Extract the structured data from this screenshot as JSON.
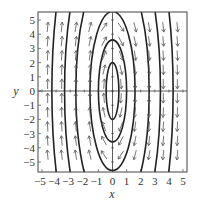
{
  "chart_data": {
    "type": "phase-portrait",
    "title": "",
    "xlabel": "x",
    "ylabel": "y",
    "xlim": [
      -5.3,
      5.3
    ],
    "ylim": [
      -5.7,
      5.5
    ],
    "xticks": [
      -5,
      -4,
      -3,
      -2,
      -1,
      0,
      1,
      2,
      3,
      4,
      5
    ],
    "yticks": [
      -5,
      -4,
      -3,
      -2,
      -1,
      0,
      1,
      2,
      3,
      4,
      5
    ],
    "xtick_labels": [
      "−5",
      "−4",
      "−3",
      "−2",
      "−1",
      "0",
      "1",
      "2",
      "3",
      "4",
      "5"
    ],
    "ytick_labels": [
      "−5",
      "−4",
      "−3",
      "−2",
      "−1",
      "0",
      "1",
      "2",
      "3",
      "4",
      "5"
    ],
    "grid": false,
    "axes_lines": true,
    "direction_field": {
      "description": "Arrows point upward for x<0 and downward for x>0, rotating clockwise around origin",
      "x_positions": [
        -4.6,
        -3.6,
        -2.6,
        -1.6,
        -0.6,
        0.6,
        1.6,
        2.6,
        3.6,
        4.6
      ],
      "y_positions": [
        4.5,
        3.5,
        2.5,
        1.5,
        0.5,
        -0.5,
        -1.5,
        -2.5,
        -3.5,
        -4.5
      ]
    },
    "trajectories": [
      {
        "type": "ellipse",
        "a": 0.45,
        "b": 2.0
      },
      {
        "type": "ellipse",
        "a": 1.0,
        "b": 3.6
      },
      {
        "type": "ellipse",
        "a": 1.6,
        "b": 5.6
      },
      {
        "type": "ellipse",
        "a": 2.6,
        "b": 9.0
      },
      {
        "type": "ellipse",
        "a": 3.4,
        "b": 12.0
      },
      {
        "type": "ellipse",
        "a": 4.3,
        "b": 15.0
      }
    ],
    "colors": {
      "curve": "#222222",
      "arrow": "#555555",
      "axis": "#333333"
    }
  },
  "axes": {
    "xlabel": "x",
    "ylabel": "y"
  }
}
